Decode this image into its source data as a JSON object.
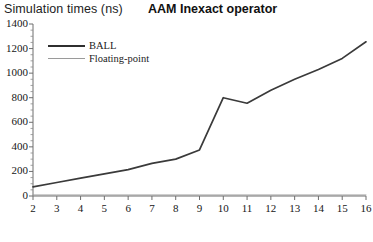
{
  "chart_data": {
    "type": "line",
    "title": "AAM Inexact operator",
    "xlabel": "Operand bit-width",
    "ylabel": "Simulation times (ns)",
    "x": [
      2,
      3,
      4,
      5,
      6,
      7,
      8,
      9,
      10,
      11,
      12,
      13,
      14,
      15,
      16
    ],
    "series": [
      {
        "name": "BALL",
        "color": "#3a3a3a",
        "values": [
          75,
          110,
          145,
          180,
          215,
          265,
          300,
          375,
          800,
          755,
          860,
          950,
          1030,
          1120,
          1255
        ]
      },
      {
        "name": "Floating-point",
        "color": "#9a9a9a",
        "values": [
          8,
          8,
          8,
          8,
          8,
          8,
          8,
          8,
          8,
          8,
          8,
          8,
          8,
          8,
          8
        ]
      }
    ],
    "xlim": [
      2,
      16
    ],
    "ylim": [
      0,
      1400
    ],
    "xticks": [
      "2",
      "3",
      "4",
      "5",
      "6",
      "7",
      "8",
      "9",
      "10",
      "11",
      "12",
      "13",
      "14",
      "15",
      "16"
    ],
    "yticks": [
      "0",
      "200",
      "400",
      "600",
      "800",
      "1000",
      "1200",
      "1400"
    ],
    "grid": false,
    "legend_position": "upper-left"
  },
  "legend": {
    "entries": [
      {
        "label": "BALL"
      },
      {
        "label": "Floating-point"
      }
    ]
  }
}
